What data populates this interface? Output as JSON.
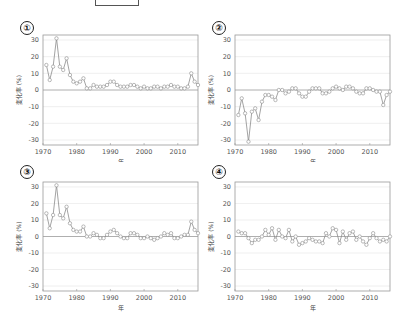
{
  "figure": {
    "top_box": "",
    "panels": [
      {
        "badge": "①"
      },
      {
        "badge": "②"
      },
      {
        "badge": "③"
      },
      {
        "badge": "④"
      }
    ]
  },
  "chart_data": [
    {
      "type": "line",
      "panel": "①",
      "title": "",
      "xlabel": "年",
      "ylabel": "変化率 (%)",
      "xlim": [
        1970,
        2016
      ],
      "ylim": [
        -33,
        33
      ],
      "xticks": [
        1970,
        1980,
        1990,
        2000,
        2010
      ],
      "yticks": [
        30,
        20,
        10,
        0,
        -10,
        -20,
        -30
      ],
      "grid": true,
      "zero_line": true,
      "marker": "circle",
      "x": [
        1971,
        1972,
        1973,
        1974,
        1975,
        1976,
        1977,
        1978,
        1979,
        1980,
        1981,
        1982,
        1983,
        1984,
        1985,
        1986,
        1987,
        1988,
        1989,
        1990,
        1991,
        1992,
        1993,
        1994,
        1995,
        1996,
        1997,
        1998,
        1999,
        2000,
        2001,
        2002,
        2003,
        2004,
        2005,
        2006,
        2007,
        2008,
        2009,
        2010,
        2011,
        2012,
        2013,
        2014,
        2015,
        2016
      ],
      "values": [
        15,
        6,
        14,
        31,
        14,
        12,
        19,
        9,
        5,
        4,
        5,
        7,
        1,
        1,
        3,
        2,
        2,
        2,
        3,
        5,
        5,
        3,
        2,
        2,
        2,
        3,
        3,
        2,
        1,
        2,
        1,
        1,
        2,
        2,
        1,
        2,
        2,
        3,
        2,
        2,
        1,
        1,
        2,
        10,
        5,
        3
      ]
    },
    {
      "type": "line",
      "panel": "②",
      "title": "",
      "xlabel": "年",
      "ylabel": "変化率 (%)",
      "xlim": [
        1970,
        2016
      ],
      "ylim": [
        -33,
        33
      ],
      "xticks": [
        1970,
        1980,
        1990,
        2000,
        2010
      ],
      "yticks": [
        30,
        20,
        10,
        0,
        -10,
        -20,
        -30
      ],
      "grid": true,
      "zero_line": true,
      "marker": "circle",
      "x": [
        1971,
        1972,
        1973,
        1974,
        1975,
        1976,
        1977,
        1978,
        1979,
        1980,
        1981,
        1982,
        1983,
        1984,
        1985,
        1986,
        1987,
        1988,
        1989,
        1990,
        1991,
        1992,
        1993,
        1994,
        1995,
        1996,
        1997,
        1998,
        1999,
        2000,
        2001,
        2002,
        2003,
        2004,
        2005,
        2006,
        2007,
        2008,
        2009,
        2010,
        2011,
        2012,
        2013,
        2014,
        2015,
        2016
      ],
      "values": [
        -15,
        -5,
        -14,
        -31,
        -13,
        -11,
        -18,
        -7,
        -3,
        -3,
        -4,
        -6,
        0,
        0,
        -2,
        -1,
        1,
        1,
        -2,
        -4,
        -4,
        -1,
        1,
        1,
        1,
        -2,
        -2,
        -1,
        1,
        2,
        1,
        0,
        2,
        2,
        1,
        -1,
        -2,
        -2,
        1,
        1,
        0,
        -1,
        -1,
        -9,
        -3,
        -1
      ]
    },
    {
      "type": "line",
      "panel": "③",
      "title": "",
      "xlabel": "年",
      "ylabel": "変化率 (%)",
      "xlim": [
        1970,
        2016
      ],
      "ylim": [
        -33,
        33
      ],
      "xticks": [
        1970,
        1980,
        1990,
        2000,
        2010
      ],
      "yticks": [
        30,
        20,
        10,
        0,
        -10,
        -20,
        -30
      ],
      "grid": true,
      "zero_line": true,
      "marker": "circle",
      "x": [
        1971,
        1972,
        1973,
        1974,
        1975,
        1976,
        1977,
        1978,
        1979,
        1980,
        1981,
        1982,
        1983,
        1984,
        1985,
        1986,
        1987,
        1988,
        1989,
        1990,
        1991,
        1992,
        1993,
        1994,
        1995,
        1996,
        1997,
        1998,
        1999,
        2000,
        2001,
        2002,
        2003,
        2004,
        2005,
        2006,
        2007,
        2008,
        2009,
        2010,
        2011,
        2012,
        2013,
        2014,
        2015,
        2016
      ],
      "values": [
        14,
        5,
        13,
        31,
        13,
        11,
        18,
        8,
        4,
        3,
        3,
        6,
        0,
        0,
        2,
        1,
        -1,
        -1,
        1,
        3,
        4,
        2,
        0,
        -1,
        -1,
        2,
        2,
        1,
        -1,
        -1,
        0,
        -1,
        -2,
        -1,
        0,
        2,
        1,
        2,
        -1,
        -1,
        0,
        1,
        1,
        9,
        4,
        2
      ]
    },
    {
      "type": "line",
      "panel": "④",
      "title": "",
      "xlabel": "年",
      "ylabel": "変化率 (%)",
      "xlim": [
        1970,
        2016
      ],
      "ylim": [
        -33,
        33
      ],
      "xticks": [
        1970,
        1980,
        1990,
        2000,
        2010
      ],
      "yticks": [
        30,
        20,
        10,
        0,
        -10,
        -20,
        -30
      ],
      "grid": true,
      "zero_line": true,
      "marker": "circle",
      "x": [
        1971,
        1972,
        1973,
        1974,
        1975,
        1976,
        1977,
        1978,
        1979,
        1980,
        1981,
        1982,
        1983,
        1984,
        1985,
        1986,
        1987,
        1988,
        1989,
        1990,
        1991,
        1992,
        1993,
        1994,
        1995,
        1996,
        1997,
        1998,
        1999,
        2000,
        2001,
        2002,
        2003,
        2004,
        2005,
        2006,
        2007,
        2008,
        2009,
        2010,
        2011,
        2012,
        2013,
        2014,
        2015,
        2016
      ],
      "values": [
        3,
        2,
        2,
        -1,
        -4,
        -2,
        -2,
        0,
        4,
        1,
        5,
        -2,
        4,
        0,
        -1,
        4,
        -3,
        0,
        -5,
        -4,
        -3,
        -1,
        -2,
        -3,
        -3,
        -4,
        2,
        0,
        5,
        4,
        -4,
        3,
        -2,
        2,
        3,
        -2,
        0,
        -3,
        -5,
        -1,
        2,
        -1,
        -3,
        -2,
        -3,
        0
      ]
    }
  ]
}
